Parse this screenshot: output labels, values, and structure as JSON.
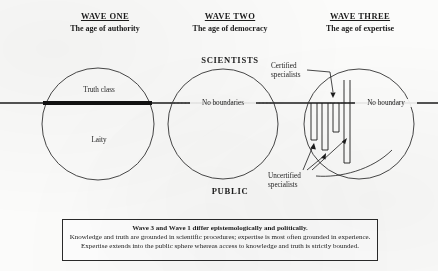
{
  "waves": [
    {
      "title": "WAVE ONE",
      "subtitle": "The age of authority"
    },
    {
      "title": "WAVE TWO",
      "subtitle": "The age of democracy"
    },
    {
      "title": "WAVE THREE",
      "subtitle": "The age of expertise"
    }
  ],
  "bands": {
    "top": "SCIENTISTS",
    "bottom": "PUBLIC"
  },
  "circles": {
    "wave_one": {
      "upper_label": "Truth class",
      "lower_label": "Laity"
    },
    "wave_two": {
      "boundary_label": "No boundaries"
    },
    "wave_three": {
      "boundary_label": "No boundary",
      "certified_label": "Certified\nspecialists",
      "certified_line1": "Certified",
      "certified_line2": "specialists",
      "uncertified_line1": "Uncertified",
      "uncertified_line2": "specialists"
    }
  },
  "caption": {
    "line1": "Wave 3 and Wave 1 differ epistemologically and politically.",
    "line2": "Knowledge and truth are grounded in scientific procedures; expertise is most often grounded in experience.",
    "line3": "Expertise extends into the public sphere whereas access to knowledge and truth is strictly bounded."
  },
  "colors": {
    "ink": "#1b1b1b",
    "paper": "#fbfbfa",
    "rule": "#2a2a2a"
  }
}
